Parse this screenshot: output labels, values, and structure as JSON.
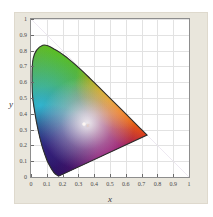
{
  "chart_data": {
    "type": "scatter",
    "title": "",
    "subtitle": "",
    "xlabel": "x",
    "ylabel": "y",
    "xlim": [
      0,
      1
    ],
    "ylim": [
      0,
      1
    ],
    "grid": true,
    "legend": null,
    "x_ticks": [
      "0",
      "0.1",
      "0.2",
      "0.3",
      "0.4",
      "0.5",
      "0.6",
      "0.7",
      "0.8",
      "0.9",
      "1"
    ],
    "x_tick_values": [
      0,
      0.1,
      0.2,
      0.3,
      0.4,
      0.5,
      0.6,
      0.7,
      0.8,
      0.9,
      1
    ],
    "y_ticks": [
      "0",
      "0.1",
      "0.2",
      "0.3",
      "0.4",
      "0.5",
      "0.6",
      "0.7",
      "0.8",
      "0.9",
      "1"
    ],
    "y_tick_values": [
      0,
      0.1,
      0.2,
      0.3,
      0.4,
      0.5,
      0.6,
      0.7,
      0.8,
      0.9,
      1
    ],
    "annotations": [
      {
        "label": "E",
        "x": 0.3333,
        "y": 0.3333,
        "marker": "white-point"
      }
    ],
    "gamut_outline": [
      {
        "x": 0.1741,
        "y": 0.005
      },
      {
        "x": 0.144,
        "y": 0.0297
      },
      {
        "x": 0.1096,
        "y": 0.0868
      },
      {
        "x": 0.0913,
        "y": 0.1327
      },
      {
        "x": 0.0687,
        "y": 0.2007
      },
      {
        "x": 0.0454,
        "y": 0.295
      },
      {
        "x": 0.0235,
        "y": 0.4127
      },
      {
        "x": 0.0082,
        "y": 0.5384
      },
      {
        "x": 0.0139,
        "y": 0.7502
      },
      {
        "x": 0.0743,
        "y": 0.8338
      },
      {
        "x": 0.1547,
        "y": 0.8059
      },
      {
        "x": 0.2296,
        "y": 0.7543
      },
      {
        "x": 0.3016,
        "y": 0.6923
      },
      {
        "x": 0.3731,
        "y": 0.6245
      },
      {
        "x": 0.4441,
        "y": 0.5547
      },
      {
        "x": 0.5125,
        "y": 0.4866
      },
      {
        "x": 0.5752,
        "y": 0.4242
      },
      {
        "x": 0.627,
        "y": 0.3725
      },
      {
        "x": 0.6915,
        "y": 0.3083
      },
      {
        "x": 0.7347,
        "y": 0.2653
      }
    ],
    "vertex_colors": {
      "red": "#ee1b11",
      "green": "#6aba2a",
      "blue": "#1a1270",
      "violet": "#7b1f84",
      "cyan": "#3fa7c8",
      "yellow": "#f2d211",
      "magenta": "#d7198a"
    }
  },
  "figure": {
    "background_color": "#ffffff",
    "panel_color": "#e9e6dc",
    "plot_background": "#ffffff",
    "grid_color": "#e2e2e2",
    "axis_color": "#8d8d8d",
    "tick_label_color": "#4a4a4a"
  }
}
